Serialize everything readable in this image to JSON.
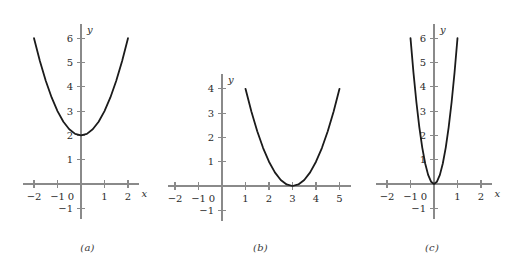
{
  "figure": {
    "background_color": "#ffffff",
    "axis_color": "#8a8a8a",
    "curve_color": "#1b1b1b",
    "label_color": "#2b2b2b"
  },
  "chart_data": [
    {
      "type": "line",
      "panel_label": "(a)",
      "title": "",
      "xlabel": "x",
      "ylabel": "y",
      "equation": "y = x^2 + 2",
      "vertex": [
        0,
        2
      ],
      "xlim": [
        -2.45,
        2.45
      ],
      "ylim": [
        -1.45,
        6.6
      ],
      "grid": false,
      "legend": "none",
      "xticks": [
        -2,
        -1,
        1,
        2
      ],
      "xticklabels": [
        "-2",
        "-1",
        "1",
        "2"
      ],
      "yticks": [
        -1,
        1,
        2,
        3,
        4,
        5,
        6
      ],
      "yticklabels": [
        "-1",
        "1",
        "2",
        "3",
        "4",
        "5",
        "6"
      ],
      "origin_label": "0",
      "x": [
        -2,
        -1.75,
        -1.5,
        -1.25,
        -1,
        -0.75,
        -0.5,
        -0.25,
        0,
        0.25,
        0.5,
        0.75,
        1,
        1.25,
        1.5,
        1.75,
        2
      ],
      "y": [
        6,
        5.0625,
        4.25,
        3.5625,
        3,
        2.5625,
        2.25,
        2.0625,
        2,
        2.0625,
        2.25,
        2.5625,
        3,
        3.5625,
        4.25,
        5.0625,
        6
      ]
    },
    {
      "type": "line",
      "panel_label": "(b)",
      "title": "",
      "xlabel": "x",
      "ylabel": "y",
      "equation": "y = (x - 3)^2",
      "vertex": [
        3,
        0
      ],
      "xlim": [
        -2.45,
        5.5
      ],
      "ylim": [
        -1.45,
        4.6
      ],
      "grid": false,
      "legend": "none",
      "xticks": [
        -2,
        -1,
        1,
        2,
        3,
        4,
        5
      ],
      "xticklabels": [
        "-2",
        "-1",
        "1",
        "2",
        "3",
        "4",
        "5"
      ],
      "yticks": [
        -1,
        1,
        2,
        3,
        4
      ],
      "yticklabels": [
        "-1",
        "1",
        "2",
        "3",
        "4"
      ],
      "origin_label": "0",
      "x": [
        1,
        1.25,
        1.5,
        1.75,
        2,
        2.25,
        2.5,
        2.75,
        3,
        3.25,
        3.5,
        3.75,
        4,
        4.25,
        4.5,
        4.75,
        5
      ],
      "y": [
        4,
        3.0625,
        2.25,
        1.5625,
        1,
        0.5625,
        0.25,
        0.0625,
        0,
        0.0625,
        0.25,
        0.5625,
        1,
        1.5625,
        2.25,
        3.0625,
        4
      ]
    },
    {
      "type": "line",
      "panel_label": "(c)",
      "title": "",
      "xlabel": "x",
      "ylabel": "y",
      "equation": "y = 6x^2",
      "vertex": [
        0,
        0
      ],
      "xlim": [
        -2.45,
        2.45
      ],
      "ylim": [
        -1.45,
        6.6
      ],
      "grid": false,
      "legend": "none",
      "xticks": [
        -2,
        -1,
        1,
        2
      ],
      "xticklabels": [
        "-2",
        "-1",
        "1",
        "2"
      ],
      "yticks": [
        -1,
        1,
        2,
        3,
        4,
        5,
        6
      ],
      "yticklabels": [
        "-1",
        "1",
        "2",
        "3",
        "4",
        "5",
        "6"
      ],
      "origin_label": "0",
      "x": [
        -1,
        -0.875,
        -0.75,
        -0.625,
        -0.5,
        -0.375,
        -0.25,
        -0.125,
        0,
        0.125,
        0.25,
        0.375,
        0.5,
        0.625,
        0.75,
        0.875,
        1
      ],
      "y": [
        6,
        4.59375,
        3.375,
        2.34375,
        1.5,
        0.84375,
        0.375,
        0.09375,
        0,
        0.09375,
        0.375,
        0.84375,
        1.5,
        2.34375,
        3.375,
        4.59375,
        6
      ]
    }
  ]
}
